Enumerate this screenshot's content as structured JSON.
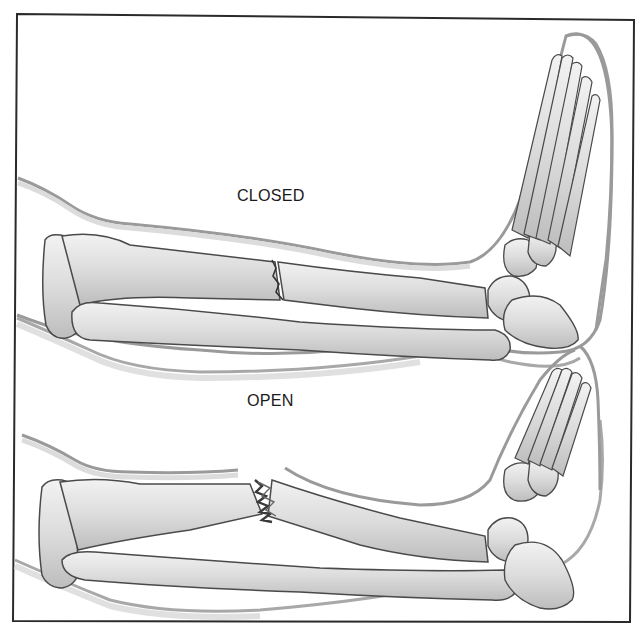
{
  "figure": {
    "panels": [
      {
        "id": "closed",
        "label": "CLOSED"
      },
      {
        "id": "open",
        "label": "OPEN"
      }
    ],
    "colors": {
      "border": "#2a2a2a",
      "bone_fill": "#e4e4e4",
      "bone_shadow": "#b8b8b8",
      "outline": "#4a4a4a",
      "skin_outline": "#9a9a9a",
      "skin_shade": "#d6d6d6",
      "wound": "#555555"
    }
  }
}
